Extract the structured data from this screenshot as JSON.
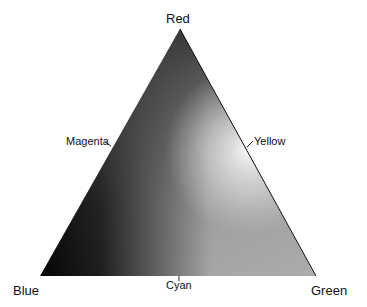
{
  "diagram": {
    "type": "color-triangle",
    "vertices": {
      "top": {
        "label": "Red",
        "shade": "#3c3c3c"
      },
      "bottom_left": {
        "label": "Blue",
        "shade": "#050505"
      },
      "bottom_right": {
        "label": "Green",
        "shade": "#a9a9a9"
      }
    },
    "edge_labels": {
      "left": "Magenta",
      "right": "Yellow",
      "bottom": "Cyan"
    },
    "colors": {
      "outline": "#111111",
      "highlight": "#f4f4f4",
      "background": "#ffffff"
    }
  }
}
